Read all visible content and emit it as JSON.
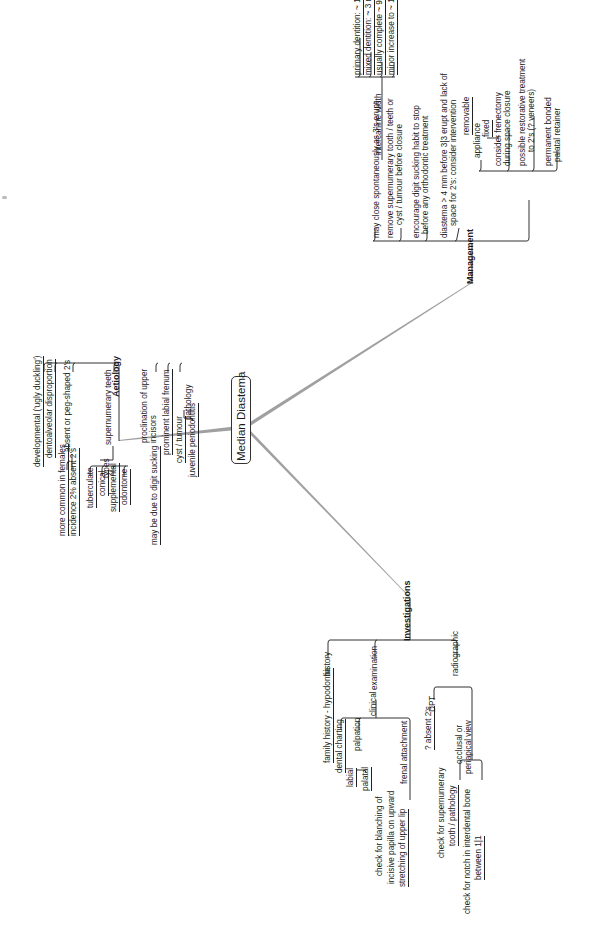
{
  "diagram": {
    "type": "mind-map",
    "orientation": "rotated -90deg",
    "central_topic": "Median Diastema",
    "branches": [
      {
        "label": "Aetiology",
        "children": [
          {
            "label": "developmental ('ugly duckling')"
          },
          {
            "label": "dentoalveolar disproportion"
          },
          {
            "label": "absent or peg-shaped 2's",
            "children": [
              {
                "label": "more common in females"
              },
              {
                "label": "incidence 2% absent 2's"
              }
            ]
          },
          {
            "label": "supernumerary teeth",
            "children": [
              {
                "label": "types",
                "children": [
                  {
                    "label": "tuberculate"
                  },
                  {
                    "label": "conical"
                  },
                  {
                    "label": "supplemental"
                  },
                  {
                    "label": "odontome"
                  }
                ]
              }
            ]
          },
          {
            "label": "proclination of upper incisors",
            "children": [
              {
                "label": "may be due to digit sucking"
              }
            ]
          },
          {
            "label": "prominent labial frenum"
          },
          {
            "label": "pathology",
            "children": [
              {
                "label": "cyst / tumour"
              },
              {
                "label": "juvenile periodontitis"
              }
            ]
          }
        ]
      },
      {
        "label": "Management",
        "children": [
          {
            "label": "may close spontaneously as 3's erupt",
            "children": [
              {
                "label": "intercanine width",
                "children": [
                  {
                    "label": "primary dentition: ~ 1-2 mm increase"
                  },
                  {
                    "label": "mixed dentition: ~ 3 mm increase"
                  },
                  {
                    "label": "usually complete ~ 9 years"
                  },
                  {
                    "label": "minor increase to ~ 13 years"
                  }
                ]
              }
            ]
          },
          {
            "label": "remove supernumerary tooth / teeth or cyst / tumour before closure"
          },
          {
            "label": "encourage digit sucking habit to stop before any orthodontic treatment"
          },
          {
            "label": "diastema > 4 mm before 3|3 erupt and lack of space for 2's: consider intervention",
            "children": [
              {
                "label": "appliance",
                "children": [
                  {
                    "label": "removable"
                  },
                  {
                    "label": "fixed"
                  }
                ]
              },
              {
                "label": "consider frenectomy during space closure"
              },
              {
                "label": "possible restorative treatment to 2's (? veneers)"
              },
              {
                "label": "permanent bonded palatal retainer"
              }
            ]
          }
        ]
      },
      {
        "label": "Investigations",
        "children": [
          {
            "label": "history",
            "children": [
              {
                "label": "family history - hypodontia"
              }
            ]
          },
          {
            "label": "examination",
            "children": [
              {
                "label": "clinical",
                "children": [
                  {
                    "label": "dental charting"
                  },
                  {
                    "label": "palpation",
                    "children": [
                      {
                        "label": "labial"
                      },
                      {
                        "label": "palatal"
                      }
                    ]
                  },
                  {
                    "label": "frenal attachment",
                    "children": [
                      {
                        "label": "check for blanching of incisive papilla on upward stretching of upper lip"
                      }
                    ]
                  }
                ]
              }
            ]
          },
          {
            "label": "radiographic",
            "children": [
              {
                "label": "DPT",
                "children": [
                  {
                    "label": "? absent 2's"
                  }
                ]
              },
              {
                "label": "occlusal or periapical view",
                "children": [
                  {
                    "label": "check for supernumerary tooth / pathology"
                  },
                  {
                    "label": "check for notch in interdental bone between 1|1"
                  }
                ]
              }
            ]
          }
        ]
      }
    ]
  },
  "labels": {
    "central": "Median Diastema",
    "aetiology": "Aetiology",
    "management": "Management",
    "investigations": "Investigations",
    "a1": "developmental ('ugly duckling')",
    "a2": "dentoalveolar disproportion",
    "a3": "absent or peg-shaped 2's",
    "a3a": "more common in females",
    "a3b": "incidence 2% absent 2's",
    "a4": "supernumerary teeth",
    "a4t": "types",
    "a4t1": "tuberculate",
    "a4t2": "conical",
    "a4t3": "supplemental",
    "a4t4": "odontome",
    "a5a": "proclination of upper",
    "a5b": "incisors",
    "a5c": "may be due to digit sucking",
    "a6": "prominent labial frenum",
    "a7": "pathology",
    "a7a": "cyst / tumour",
    "a7b": "juvenile periodontitis",
    "m1": "may close spontaneously as 3's erupt",
    "m1a": "intercanine width",
    "m1a1": "primary dentition: ~ 1-2 mm increase",
    "m1a2": "mixed dentition: ~ 3 mm increase",
    "m1a3": "usually complete ~ 9 years",
    "m1a4": "minor increase to ~ 13 years",
    "m2a": "remove supernumerary tooth / teeth or",
    "m2b": "cyst / tumour before closure",
    "m3a": "encourage digit sucking habit to stop",
    "m3b": "before any orthodontic treatment",
    "m4a": "diastema > 4 mm before 3|3 erupt and lack of",
    "m4b": "space for 2's: consider intervention",
    "m4c": "appliance",
    "m4c1": "removable",
    "m4c2": "fixed",
    "m4d1": "consider frenectomy",
    "m4d2": "during space closure",
    "m4e1": "possible restorative treatment",
    "m4e2": "to 2's (? veneers)",
    "m4f1": "permanent bonded",
    "m4f2": "palatal retainer",
    "i1": "history",
    "i1a": "family history - hypodontia",
    "i2": "examination",
    "i2a": "clinical",
    "i2a1": "dental charting",
    "i2a2": "palpation",
    "i2a2a": "labial",
    "i2a2b": "palatal",
    "i2a3": "frenal attachment",
    "i2a3a1": "check for blanching of",
    "i2a3a2": "incisive papilla on upward",
    "i2a3a3": "stretching of upper lip",
    "i3": "radiographic",
    "i3a": "DPT",
    "i3a1": "? absent 2's",
    "i3b1": "occlusal or",
    "i3b2": "periapical view",
    "i3b3a": "check for supernumerary",
    "i3b3b": "tooth / pathology",
    "i3b4a": "check for notch in interdental bone",
    "i3b4b": "between 1|1"
  },
  "colors": {
    "background": "#ffffff",
    "text": "#1a1a1a",
    "main_links": "#9a9a9a",
    "tree_lines": "#333333"
  }
}
